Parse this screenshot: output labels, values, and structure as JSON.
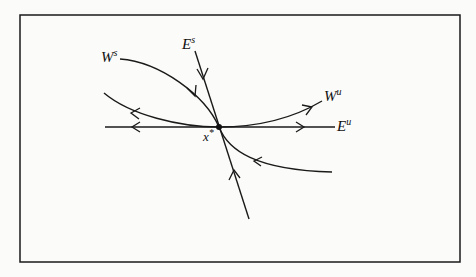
{
  "figure": {
    "labels": {
      "stable_eigenspace": "E",
      "stable_eigenspace_sup": "s",
      "unstable_eigenspace": "E",
      "unstable_eigenspace_sup": "u",
      "stable_manifold": "W",
      "stable_manifold_sup": "s",
      "unstable_manifold": "W",
      "unstable_manifold_sup": "u",
      "fixed_point": "x",
      "fixed_point_sup": "*"
    },
    "colors": {
      "stroke": "#1a1a1a",
      "background": "#fbfbf9"
    }
  }
}
